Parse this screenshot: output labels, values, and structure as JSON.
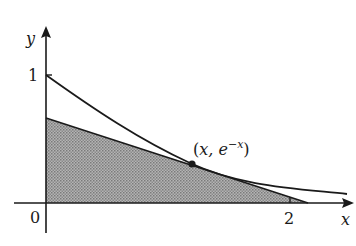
{
  "figure": {
    "axes": {
      "x_label": "x",
      "y_label": "y",
      "origin_label": "0",
      "x_tick_labels": [
        "2"
      ],
      "y_tick_labels": [
        "1"
      ]
    },
    "point_label_open": "(",
    "point_label_x": "x, e",
    "point_label_exp": "−x",
    "point_label_close": ")",
    "curve": "y = e^{-x}",
    "tangent_point_x": 1.2,
    "colors": {
      "ink": "#1a1a1a",
      "shade": "#9a9a9a",
      "background": "#ffffff"
    }
  }
}
